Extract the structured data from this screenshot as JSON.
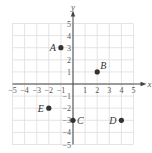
{
  "chart_data": {
    "type": "scatter",
    "title": "",
    "xlabel": "x",
    "ylabel": "y",
    "xlim": [
      -5,
      5
    ],
    "ylim": [
      -5,
      5
    ],
    "grid": true,
    "x_ticks": [
      -5,
      -4,
      -3,
      -2,
      -1,
      1,
      2,
      3,
      4,
      5
    ],
    "y_ticks": [
      5,
      4,
      3,
      2,
      1,
      -1,
      -2,
      -3,
      -4,
      -5
    ],
    "x_tick_labels": [
      "−5",
      "−4",
      "−3",
      "−2",
      "−1",
      "1",
      "2",
      "3",
      "4",
      "5"
    ],
    "y_tick_labels": [
      "5",
      "4",
      "3",
      "2",
      "1",
      "−1",
      "−2",
      "−3",
      "−4",
      "−5"
    ],
    "points": [
      {
        "label": "A",
        "x": -1,
        "y": 3,
        "label_side": "left"
      },
      {
        "label": "B",
        "x": 2,
        "y": 1,
        "label_side": "upper-right"
      },
      {
        "label": "C",
        "x": 0,
        "y": -3,
        "label_side": "right"
      },
      {
        "label": "D",
        "x": 4,
        "y": -3,
        "label_side": "left"
      },
      {
        "label": "E",
        "x": -2,
        "y": -2,
        "label_side": "left"
      }
    ]
  },
  "colors": {
    "grid": "#dddddd",
    "axis": "#444444",
    "point": "#333333"
  }
}
